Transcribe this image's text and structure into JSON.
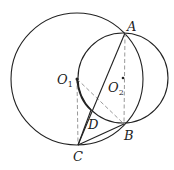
{
  "diagram": {
    "type": "geometry",
    "points": {
      "A": {
        "label": "A",
        "x": 125,
        "y": 33
      },
      "B": {
        "label": "B",
        "x": 124,
        "y": 124
      },
      "C": {
        "label": "C",
        "x": 78,
        "y": 145
      },
      "D": {
        "label": "D",
        "x": 91,
        "y": 110
      },
      "O1": {
        "label": "O",
        "sub": "1",
        "x": 77,
        "y": 79
      },
      "O2": {
        "label": "O",
        "sub": "2",
        "x": 123,
        "y": 78
      }
    },
    "circles": [
      {
        "name": "circle-O1",
        "cx": 77,
        "cy": 79,
        "r": 66
      },
      {
        "name": "circle-O2",
        "cx": 123,
        "cy": 78,
        "r": 45
      }
    ],
    "solid_segments": [
      "A-C",
      "C-B",
      "O1-D (arc)"
    ],
    "dashed_segments": [
      "O1-C",
      "O1-B",
      "A-B"
    ],
    "colors": {
      "stroke": "#222222",
      "dashed": "#999999"
    }
  }
}
